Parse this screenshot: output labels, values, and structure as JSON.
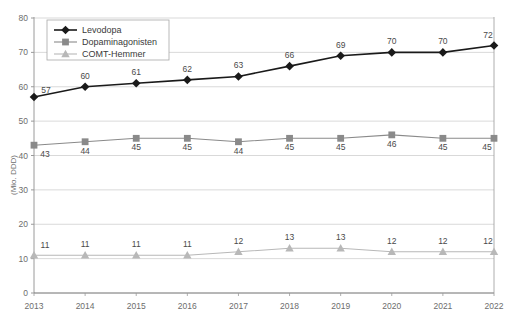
{
  "chart_data": {
    "type": "line",
    "title": "",
    "xlabel": "",
    "ylabel": "(Mio. DDD)",
    "categories": [
      "2013",
      "2014",
      "2015",
      "2016",
      "2017",
      "2018",
      "2019",
      "2020",
      "2021",
      "2022"
    ],
    "ylim": [
      0,
      80
    ],
    "ytick_step": 10,
    "yticks": [
      "0",
      "10",
      "20",
      "30",
      "40",
      "50",
      "60",
      "70",
      "80"
    ],
    "grid": true,
    "legend_position": "top-left-inside",
    "series": [
      {
        "name": "Levodopa",
        "color": "#1a1a1a",
        "marker": "diamond",
        "values": [
          57,
          60,
          61,
          62,
          63,
          66,
          69,
          70,
          70,
          72
        ],
        "labels": [
          "57",
          "60",
          "61",
          "62",
          "63",
          "66",
          "69",
          "70",
          "70",
          "72"
        ]
      },
      {
        "name": "Dopaminagonisten",
        "color": "#8a8a8a",
        "marker": "square",
        "values": [
          43,
          44,
          45,
          45,
          44,
          45,
          45,
          46,
          45,
          45
        ],
        "labels": [
          "43",
          "44",
          "45",
          "45",
          "44",
          "45",
          "45",
          "46",
          "45",
          "45"
        ]
      },
      {
        "name": "COMT-Hemmer",
        "color": "#b8b8b8",
        "marker": "triangle",
        "values": [
          11,
          11,
          11,
          11,
          12,
          13,
          13,
          12,
          12,
          12
        ],
        "labels": [
          "11",
          "11",
          "11",
          "11",
          "12",
          "13",
          "13",
          "12",
          "12",
          "12"
        ]
      }
    ]
  },
  "footnote": {
    "text": ""
  }
}
